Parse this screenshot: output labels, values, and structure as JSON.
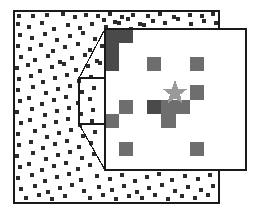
{
  "figure": {
    "type": "point-pattern-map-with-magnified-inset",
    "background_color": "#ffffff",
    "border_color": "#1a1a1a",
    "point_color": "#2b2b2b",
    "inset_cell_color": "#6e6e6e",
    "inset_dark_cell_color": "#4a4a4a",
    "star_color": "#9a9a9a",
    "connector_color": "#1a1a1a"
  },
  "main_panel": {
    "name": "main-lattice-panel",
    "x": 14,
    "y": 11,
    "width": 205,
    "height": 192,
    "border_width": 2,
    "point_size": 4,
    "points": [
      [
        17,
        14
      ],
      [
        31,
        14
      ],
      [
        45,
        13
      ],
      [
        61,
        12
      ],
      [
        73,
        15
      ],
      [
        84,
        13
      ],
      [
        96,
        14
      ],
      [
        108,
        12
      ],
      [
        120,
        15
      ],
      [
        131,
        13
      ],
      [
        146,
        14
      ],
      [
        158,
        12
      ],
      [
        172,
        15
      ],
      [
        188,
        13
      ],
      [
        200,
        14
      ],
      [
        211,
        12
      ],
      [
        16,
        22
      ],
      [
        27,
        25
      ],
      [
        40,
        21
      ],
      [
        52,
        27
      ],
      [
        66,
        23
      ],
      [
        78,
        26
      ],
      [
        90,
        22
      ],
      [
        104,
        25
      ],
      [
        117,
        21
      ],
      [
        129,
        27
      ],
      [
        142,
        23
      ],
      [
        18,
        33
      ],
      [
        30,
        36
      ],
      [
        43,
        32
      ],
      [
        55,
        38
      ],
      [
        68,
        34
      ],
      [
        81,
        31
      ],
      [
        93,
        37
      ],
      [
        106,
        33
      ],
      [
        16,
        44
      ],
      [
        28,
        47
      ],
      [
        39,
        43
      ],
      [
        51,
        49
      ],
      [
        63,
        45
      ],
      [
        76,
        42
      ],
      [
        88,
        48
      ],
      [
        100,
        44
      ],
      [
        19,
        55
      ],
      [
        33,
        58
      ],
      [
        46,
        54
      ],
      [
        58,
        60
      ],
      [
        70,
        56
      ],
      [
        83,
        53
      ],
      [
        95,
        59
      ],
      [
        15,
        66
      ],
      [
        26,
        63
      ],
      [
        38,
        69
      ],
      [
        50,
        65
      ],
      [
        62,
        62
      ],
      [
        74,
        68
      ],
      [
        86,
        64
      ],
      [
        98,
        61
      ],
      [
        17,
        77
      ],
      [
        29,
        74
      ],
      [
        41,
        80
      ],
      [
        53,
        76
      ],
      [
        65,
        73
      ],
      [
        77,
        79
      ],
      [
        89,
        75
      ],
      [
        16,
        88
      ],
      [
        31,
        85
      ],
      [
        44,
        91
      ],
      [
        56,
        87
      ],
      [
        68,
        84
      ],
      [
        80,
        90
      ],
      [
        92,
        86
      ],
      [
        18,
        99
      ],
      [
        27,
        96
      ],
      [
        40,
        102
      ],
      [
        52,
        98
      ],
      [
        64,
        95
      ],
      [
        76,
        101
      ],
      [
        88,
        97
      ],
      [
        15,
        110
      ],
      [
        30,
        107
      ],
      [
        43,
        113
      ],
      [
        55,
        109
      ],
      [
        67,
        106
      ],
      [
        79,
        112
      ],
      [
        91,
        108
      ],
      [
        19,
        121
      ],
      [
        28,
        118
      ],
      [
        42,
        124
      ],
      [
        54,
        120
      ],
      [
        66,
        117
      ],
      [
        78,
        123
      ],
      [
        90,
        119
      ],
      [
        16,
        132
      ],
      [
        33,
        129
      ],
      [
        45,
        135
      ],
      [
        57,
        131
      ],
      [
        69,
        128
      ],
      [
        81,
        134
      ],
      [
        93,
        130
      ],
      [
        17,
        143
      ],
      [
        29,
        140
      ],
      [
        41,
        146
      ],
      [
        53,
        142
      ],
      [
        65,
        139
      ],
      [
        77,
        145
      ],
      [
        89,
        141
      ],
      [
        15,
        154
      ],
      [
        31,
        151
      ],
      [
        44,
        157
      ],
      [
        56,
        153
      ],
      [
        68,
        150
      ],
      [
        80,
        156
      ],
      [
        92,
        152
      ],
      [
        18,
        165
      ],
      [
        27,
        162
      ],
      [
        40,
        168
      ],
      [
        52,
        164
      ],
      [
        64,
        161
      ],
      [
        76,
        167
      ],
      [
        88,
        163
      ],
      [
        16,
        176
      ],
      [
        30,
        173
      ],
      [
        43,
        179
      ],
      [
        55,
        175
      ],
      [
        67,
        172
      ],
      [
        79,
        178
      ],
      [
        95,
        174
      ],
      [
        108,
        177
      ],
      [
        120,
        173
      ],
      [
        133,
        179
      ],
      [
        145,
        175
      ],
      [
        157,
        172
      ],
      [
        170,
        178
      ],
      [
        183,
        174
      ],
      [
        196,
        177
      ],
      [
        208,
        173
      ],
      [
        19,
        187
      ],
      [
        33,
        184
      ],
      [
        46,
        190
      ],
      [
        58,
        186
      ],
      [
        70,
        183
      ],
      [
        82,
        189
      ],
      [
        97,
        185
      ],
      [
        110,
        188
      ],
      [
        122,
        184
      ],
      [
        135,
        190
      ],
      [
        147,
        186
      ],
      [
        160,
        183
      ],
      [
        173,
        189
      ],
      [
        186,
        185
      ],
      [
        199,
        188
      ],
      [
        211,
        184
      ],
      [
        24,
        196
      ],
      [
        37,
        193
      ],
      [
        50,
        197
      ],
      [
        63,
        194
      ],
      [
        88,
        196
      ],
      [
        101,
        193
      ],
      [
        114,
        197
      ],
      [
        127,
        194
      ],
      [
        140,
        196
      ],
      [
        153,
        193
      ],
      [
        166,
        197
      ],
      [
        180,
        194
      ],
      [
        193,
        196
      ],
      [
        206,
        193
      ],
      [
        102,
        18
      ],
      [
        113,
        20
      ],
      [
        126,
        17
      ],
      [
        138,
        22
      ],
      [
        151,
        19
      ],
      [
        163,
        21
      ],
      [
        176,
        17
      ],
      [
        189,
        22
      ],
      [
        202,
        19
      ],
      [
        214,
        21
      ],
      [
        216,
        34
      ],
      [
        215,
        52
      ],
      [
        217,
        70
      ],
      [
        216,
        95
      ],
      [
        215,
        118
      ],
      [
        217,
        140
      ],
      [
        216,
        158
      ]
    ]
  },
  "source_rectangle": {
    "name": "zoom-source-region",
    "x": 79,
    "y": 78,
    "width": 26,
    "height": 46,
    "border_width": 1.4
  },
  "connectors": {
    "name": "zoom-connector-lines",
    "lines": [
      {
        "x1": 79,
        "y1": 78,
        "x2": 105,
        "y2": 29
      },
      {
        "x1": 79,
        "y1": 124,
        "x2": 105,
        "y2": 170
      }
    ],
    "stroke_width": 1.2
  },
  "inset_panel": {
    "name": "magnified-inset-panel",
    "x": 105,
    "y": 29,
    "width": 141,
    "height": 141,
    "border_width": 1.6,
    "grid_columns": 10,
    "grid_rows": 10,
    "cell_size": 14.1,
    "occupied_cells": [
      {
        "col": 0,
        "row": 0,
        "shade": "dark"
      },
      {
        "col": 1,
        "row": 0,
        "shade": "dark"
      },
      {
        "col": 0,
        "row": 1,
        "shade": "dark"
      },
      {
        "col": 0,
        "row": 2,
        "shade": "dark"
      },
      {
        "col": 3,
        "row": 2,
        "shade": "normal"
      },
      {
        "col": 6,
        "row": 2,
        "shade": "normal"
      },
      {
        "col": 6,
        "row": 4,
        "shade": "normal"
      },
      {
        "col": 1,
        "row": 5,
        "shade": "normal"
      },
      {
        "col": 3,
        "row": 5,
        "shade": "dark"
      },
      {
        "col": 4,
        "row": 5,
        "shade": "normal"
      },
      {
        "col": 5,
        "row": 5,
        "shade": "normal"
      },
      {
        "col": 0,
        "row": 6,
        "shade": "normal"
      },
      {
        "col": 4,
        "row": 6,
        "shade": "normal"
      },
      {
        "col": 1,
        "row": 8,
        "shade": "normal"
      },
      {
        "col": 6,
        "row": 8,
        "shade": "normal"
      }
    ],
    "star_marker": {
      "name": "target-star-marker",
      "center_x": 175,
      "center_y": 93,
      "outer_radius": 13,
      "inner_radius": 5.4,
      "points": 5
    }
  }
}
